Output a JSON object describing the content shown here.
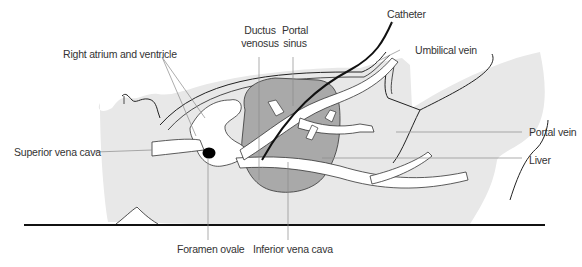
{
  "figure": {
    "type": "anatomical-diagram"
  },
  "colors": {
    "body": "#e8e8e8",
    "liver": "#a9a9a9",
    "vessels": "#ffffff",
    "outline": "#222222",
    "leader": "#8a8a8a",
    "text": "#333333"
  },
  "labels": {
    "right_atrium": "Right atrium and ventricle",
    "ductus_venosus": "Ductus\nvenosus",
    "ductus_line1": "Ductus",
    "ductus_line2": "venosus",
    "portal_sinus_line1": "Portal",
    "portal_sinus_line2": "sinus",
    "catheter": "Catheter",
    "umbilical_vein": "Umbilical vein",
    "superior_vena_cava": "Superior vena  cava",
    "portal_vein": "Portal vein",
    "liver": "Liver",
    "foramen_ovale": "Foramen ovale",
    "inferior_vena_cava": "Inferior vena cava"
  }
}
